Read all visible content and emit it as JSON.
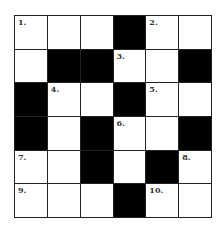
{
  "puzzle": {
    "rows": 6,
    "cols": 6,
    "grid": [
      [
        "1.",
        "",
        "",
        "#",
        "2.",
        ""
      ],
      [
        "",
        "#",
        "#",
        "3.",
        "",
        "#"
      ],
      [
        "#",
        "4.",
        "",
        "#",
        "5.",
        ""
      ],
      [
        "#",
        "",
        "#",
        "6.",
        "",
        "#"
      ],
      [
        "7.",
        "",
        "#",
        "",
        "#",
        "8."
      ],
      [
        "9.",
        "",
        "",
        "#",
        "10.",
        ""
      ]
    ],
    "colors": {
      "black": "#000000",
      "white": "#ffffff",
      "line": "#222222"
    }
  }
}
